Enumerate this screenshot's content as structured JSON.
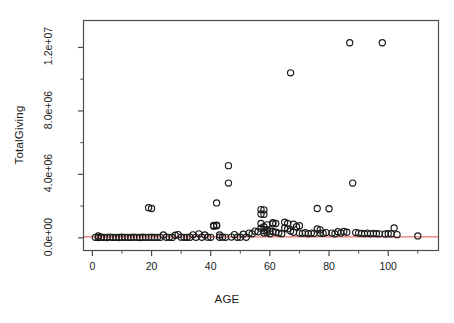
{
  "figure": {
    "background": "#ffffff",
    "axis_color": "#4d4d4d",
    "point_color": "#1a1a1a",
    "regression_color": "#e8736e"
  },
  "chart_data": {
    "type": "scatter",
    "title": "",
    "xlabel": "AGE",
    "ylabel": "TotalGiving",
    "xlim": [
      -3,
      117
    ],
    "ylim": [
      -800000,
      13700000
    ],
    "grid": false,
    "legend": null,
    "x_ticks": [
      0,
      20,
      40,
      60,
      80,
      100
    ],
    "x_tick_labels": [
      "0",
      "20",
      "40",
      "60",
      "80",
      "100"
    ],
    "x_minor_ticks": [
      10,
      30,
      50,
      70,
      90,
      110
    ],
    "y_ticks": [
      0,
      4000000,
      8000000,
      12000000
    ],
    "y_tick_labels": [
      "0.0e+00",
      "4.0e+06",
      "8.0e+06",
      "1.2e+07"
    ],
    "y_minor_ticks": [
      2000000,
      6000000,
      10000000
    ],
    "point_symbol": "open-circle",
    "regression_line": {
      "type": "horizontal-fit",
      "color": "#e8736e",
      "y_value": 60000,
      "x_start": -3,
      "x_end": 117
    },
    "series": [
      {
        "name": "Donors",
        "points": [
          [
            1,
            30000
          ],
          [
            2,
            20000
          ],
          [
            2,
            120000
          ],
          [
            3,
            40000
          ],
          [
            3,
            25000
          ],
          [
            4,
            30000
          ],
          [
            5,
            20000
          ],
          [
            6,
            45000
          ],
          [
            7,
            25000
          ],
          [
            8,
            30000
          ],
          [
            9,
            22000
          ],
          [
            10,
            35000
          ],
          [
            11,
            28000
          ],
          [
            12,
            30000
          ],
          [
            13,
            25000
          ],
          [
            14,
            40000
          ],
          [
            15,
            30000
          ],
          [
            16,
            22000
          ],
          [
            17,
            35000
          ],
          [
            18,
            28000
          ],
          [
            19,
            1900000
          ],
          [
            19,
            30000
          ],
          [
            20,
            1850000
          ],
          [
            20,
            35000
          ],
          [
            21,
            25000
          ],
          [
            22,
            30000
          ],
          [
            23,
            28000
          ],
          [
            24,
            180000
          ],
          [
            25,
            35000
          ],
          [
            26,
            30000
          ],
          [
            27,
            25000
          ],
          [
            28,
            160000
          ],
          [
            29,
            200000
          ],
          [
            30,
            40000
          ],
          [
            31,
            30000
          ],
          [
            32,
            28000
          ],
          [
            33,
            35000
          ],
          [
            34,
            190000
          ],
          [
            35,
            30000
          ],
          [
            36,
            250000
          ],
          [
            37,
            35000
          ],
          [
            38,
            180000
          ],
          [
            39,
            40000
          ],
          [
            40,
            30000
          ],
          [
            41,
            780000
          ],
          [
            41,
            730000
          ],
          [
            42,
            800000
          ],
          [
            42,
            760000
          ],
          [
            42,
            2200000
          ],
          [
            43,
            35000
          ],
          [
            43,
            180000
          ],
          [
            44,
            40000
          ],
          [
            45,
            30000
          ],
          [
            46,
            4550000
          ],
          [
            46,
            3450000
          ],
          [
            47,
            45000
          ],
          [
            48,
            200000
          ],
          [
            49,
            35000
          ],
          [
            50,
            40000
          ],
          [
            51,
            230000
          ],
          [
            52,
            35000
          ],
          [
            53,
            300000
          ],
          [
            54,
            250000
          ],
          [
            55,
            420000
          ],
          [
            56,
            380000
          ],
          [
            57,
            1780000
          ],
          [
            57,
            1500000
          ],
          [
            57,
            900000
          ],
          [
            57,
            600000
          ],
          [
            58,
            1760000
          ],
          [
            58,
            1480000
          ],
          [
            58,
            700000
          ],
          [
            58,
            450000
          ],
          [
            58,
            300000
          ],
          [
            59,
            820000
          ],
          [
            59,
            520000
          ],
          [
            59,
            330000
          ],
          [
            60,
            420000
          ],
          [
            60,
            250000
          ],
          [
            61,
            950000
          ],
          [
            61,
            880000
          ],
          [
            61,
            400000
          ],
          [
            62,
            900000
          ],
          [
            62,
            350000
          ],
          [
            63,
            300000
          ],
          [
            64,
            260000
          ],
          [
            65,
            980000
          ],
          [
            65,
            620000
          ],
          [
            66,
            900000
          ],
          [
            66,
            560000
          ],
          [
            67,
            10400000
          ],
          [
            67,
            430000
          ],
          [
            68,
            860000
          ],
          [
            68,
            350000
          ],
          [
            69,
            700000
          ],
          [
            70,
            760000
          ],
          [
            70,
            300000
          ],
          [
            71,
            280000
          ],
          [
            72,
            320000
          ],
          [
            73,
            250000
          ],
          [
            74,
            300000
          ],
          [
            75,
            280000
          ],
          [
            76,
            1850000
          ],
          [
            76,
            560000
          ],
          [
            77,
            500000
          ],
          [
            77,
            300000
          ],
          [
            78,
            280000
          ],
          [
            79,
            330000
          ],
          [
            80,
            1830000
          ],
          [
            81,
            300000
          ],
          [
            82,
            250000
          ],
          [
            83,
            380000
          ],
          [
            84,
            300000
          ],
          [
            85,
            400000
          ],
          [
            86,
            350000
          ],
          [
            87,
            12300000
          ],
          [
            88,
            3450000
          ],
          [
            89,
            330000
          ],
          [
            90,
            300000
          ],
          [
            91,
            280000
          ],
          [
            92,
            260000
          ],
          [
            93,
            300000
          ],
          [
            94,
            250000
          ],
          [
            95,
            280000
          ],
          [
            96,
            260000
          ],
          [
            97,
            250000
          ],
          [
            98,
            12300000
          ],
          [
            99,
            240000
          ],
          [
            100,
            260000
          ],
          [
            101,
            250000
          ],
          [
            102,
            620000
          ],
          [
            103,
            200000
          ],
          [
            110,
            120000
          ]
        ]
      }
    ]
  }
}
